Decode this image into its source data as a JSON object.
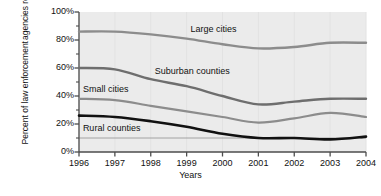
{
  "chart_data": {
    "type": "line",
    "title": "",
    "xlabel": "Years",
    "ylabel": "Percent of law enforcement agencies reporting gang problems",
    "ylabel_lines": [
      "Percent of law enforcement",
      "agencies reporting gang problems"
    ],
    "x": [
      1996,
      1997,
      1998,
      1999,
      2000,
      2001,
      2002,
      2003,
      2004
    ],
    "xtick_labels": [
      "1996",
      "1997",
      "1998",
      "1999",
      "2000",
      "2001",
      "2002",
      "2003",
      "2004"
    ],
    "ytick_labels": [
      "0%",
      "20%",
      "40%",
      "60%",
      "80%",
      "100%"
    ],
    "ytick_values": [
      0,
      20,
      40,
      60,
      80,
      100
    ],
    "yminor_values": [
      10,
      30,
      50,
      70,
      90
    ],
    "xlim": [
      1996,
      2004
    ],
    "ylim": [
      0,
      100
    ],
    "grid": "horizontal-10-percent-only",
    "legend": "inline-annotations",
    "series": [
      {
        "name": "Large cities",
        "color": "#8c8c8c",
        "width": 2.4,
        "values": [
          86,
          86,
          84,
          81,
          77,
          74,
          75,
          78,
          78
        ],
        "label_x": 2000,
        "label_y": 88
      },
      {
        "name": "Suburban counties",
        "color": "#6e6e6e",
        "width": 2.4,
        "values": [
          60,
          59,
          52,
          47,
          40,
          34,
          36,
          38,
          38
        ],
        "label_x": 1999,
        "label_y": 58
      },
      {
        "name": "Small cities",
        "color": "#8c8c8c",
        "width": 2.2,
        "values": [
          38,
          37,
          33,
          29,
          25,
          21,
          24,
          28,
          25
        ],
        "label_x": 1997,
        "label_y": 45
      },
      {
        "name": "Rural counties",
        "color": "#111111",
        "width": 2.6,
        "values": [
          26,
          25,
          22,
          18,
          13,
          10,
          10,
          9,
          11
        ],
        "label_x": 1997,
        "label_y": 17
      }
    ],
    "plot_background": "#ebebeb",
    "axis_color": "#4d4d4d"
  }
}
